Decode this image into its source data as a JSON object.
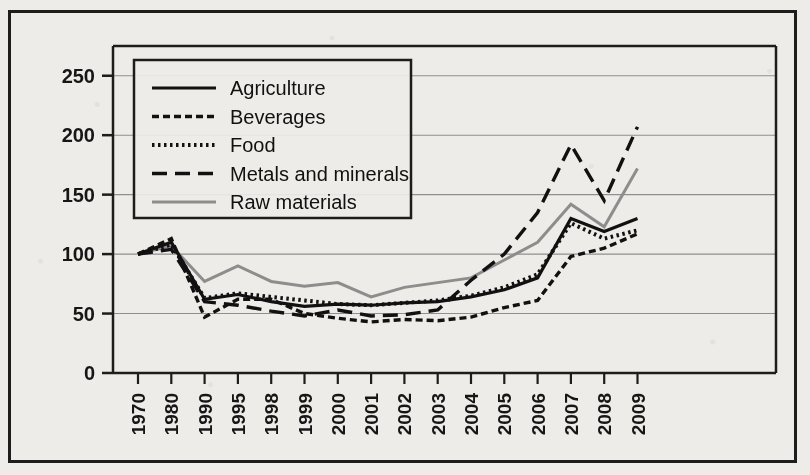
{
  "chart_data": {
    "type": "line",
    "title": "",
    "subtitle": "",
    "xlabel": "",
    "ylabel": "",
    "categories": [
      "1970",
      "1980",
      "1990",
      "1995",
      "1998",
      "1999",
      "2000",
      "2001",
      "2002",
      "2003",
      "2004",
      "2005",
      "2006",
      "2007",
      "2008",
      "2009"
    ],
    "ylim": [
      0,
      275
    ],
    "y_ticks": [
      0,
      50,
      100,
      150,
      200,
      250
    ],
    "grid": "horizontal",
    "legend_position": "top-left-inset",
    "series": [
      {
        "name": "Agriculture",
        "style": "solid",
        "color": "#111111",
        "values": [
          100,
          110,
          62,
          66,
          60,
          56,
          58,
          57,
          59,
          60,
          64,
          70,
          80,
          130,
          119,
          130
        ]
      },
      {
        "name": "Beverages",
        "style": "dashed-fine",
        "color": "#111111",
        "values": [
          100,
          113,
          47,
          62,
          62,
          50,
          46,
          43,
          45,
          44,
          47,
          55,
          61,
          98,
          105,
          117
        ]
      },
      {
        "name": "Food",
        "style": "dotted",
        "color": "#111111",
        "values": [
          100,
          108,
          63,
          67,
          64,
          61,
          58,
          57,
          59,
          61,
          65,
          72,
          83,
          126,
          113,
          120
        ]
      },
      {
        "name": "Metals and minerals",
        "style": "dashed-long",
        "color": "#111111",
        "values": [
          100,
          104,
          60,
          57,
          52,
          48,
          53,
          48,
          49,
          53,
          78,
          100,
          135,
          192,
          145,
          207
        ]
      },
      {
        "name": "Raw materials",
        "style": "solid-gray",
        "color": "#8d8d8d",
        "values": [
          100,
          107,
          77,
          90,
          77,
          73,
          76,
          64,
          72,
          76,
          80,
          95,
          110,
          142,
          123,
          172
        ]
      }
    ]
  },
  "legend": {
    "items": [
      {
        "label": "Agriculture"
      },
      {
        "label": "Beverages"
      },
      {
        "label": "Food"
      },
      {
        "label": "Metals and minerals"
      },
      {
        "label": "Raw materials"
      }
    ]
  },
  "axes": {
    "y_tick_labels": [
      "250",
      "200",
      "150",
      "100",
      "50",
      "0"
    ],
    "x_tick_labels": [
      "1970",
      "1980",
      "1990",
      "1995",
      "1998",
      "1999",
      "2000",
      "2001",
      "2002",
      "2003",
      "2004",
      "2005",
      "2006",
      "2007",
      "2008",
      "2009"
    ]
  },
  "colors": {
    "ink": "#111111",
    "gray_series": "#8d8d8d",
    "grid": "#8f8f8f",
    "paper": "#eeece8"
  }
}
